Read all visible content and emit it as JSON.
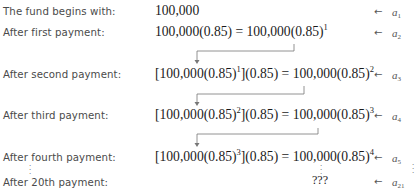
{
  "rows": [
    {
      "label": "The fund begins with:",
      "expr_pre": "100,000",
      "expr_sup": "",
      "expr_post": "",
      "tag_base": "a",
      "tag_sub": "1"
    },
    {
      "label": "After first payment:",
      "expr_pre": "100,000(0.85) = 100,000(0.85)",
      "expr_sup": "1",
      "expr_post": "",
      "tag_base": "a",
      "tag_sub": "2"
    },
    {
      "label": "After second payment:",
      "expr_pre": "[100,000(0.85)",
      "expr_sup_inner": "1",
      "expr_mid": "](0.85) = 100,000(0.85)",
      "expr_sup": "2",
      "tag_base": "a",
      "tag_sub": "3"
    },
    {
      "label": "After third payment:",
      "expr_pre": "[100,000(0.85)",
      "expr_sup_inner": "2",
      "expr_mid": "](0.85) = 100,000(0.85)",
      "expr_sup": "3",
      "tag_base": "a",
      "tag_sub": "4"
    },
    {
      "label": "After fourth payment:",
      "expr_pre": "[100,000(0.85)",
      "expr_sup_inner": "3",
      "expr_mid": "](0.85) = 100,000(0.85)",
      "expr_sup": "4",
      "tag_base": "a",
      "tag_sub": "5"
    },
    {
      "label": "After 20th payment:",
      "expr_pre": "???",
      "tag_base": "a",
      "tag_sub": "21"
    }
  ],
  "arrow_glyph": "←",
  "ellipsis_glyph": "⋮"
}
